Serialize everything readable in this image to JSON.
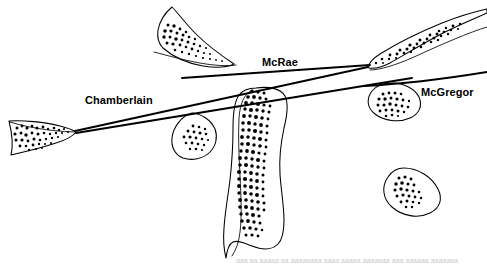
{
  "figure": {
    "type": "geological-sketch-map",
    "background_color": "#ffffff",
    "ink_color": "#000000",
    "width": 487,
    "height": 265,
    "labels": [
      {
        "id": "chamberlain",
        "text": "Chamberlain",
        "x": 85,
        "y": 95
      },
      {
        "id": "mcrae",
        "text": "McRae",
        "x": 262,
        "y": 57
      },
      {
        "id": "mcgregor",
        "text": "McGregor",
        "x": 421,
        "y": 87
      }
    ],
    "structural_lines": [
      {
        "name": "Chamberlain",
        "description": "long straight fault trace running from lower-left wedge tip up to the right convergence node",
        "path": "M 75 131 L 368 67"
      },
      {
        "name": "Chamberlain-splay",
        "description": "second near-parallel trace just below the Chamberlain line",
        "path": "M 76 133 L 410 78"
      },
      {
        "name": "McRae",
        "description": "straight trace beneath the McRae label, rising gently to the right node",
        "path": "M 182 77 L 369 65"
      },
      {
        "name": "McGregor",
        "description": "trace continuing to the right edge beneath the McGregor label",
        "path": "M 366 84 L 487 72"
      }
    ],
    "mineralized_bodies": [
      {
        "id": "west-wedge",
        "description": "triangular wedge at far left, apex east, stippled interior"
      },
      {
        "id": "north-flame",
        "description": "elongate flame-shaped body upper-left of centre, stippled"
      },
      {
        "id": "northeast-flame",
        "description": "elongate flame-shaped body at upper right, stippled"
      },
      {
        "id": "central-column",
        "description": "large elongate north-south column through the centre, densely stippled"
      },
      {
        "id": "small-triangle",
        "description": "small rounded-triangular body left of the central column"
      },
      {
        "id": "east-oval",
        "description": "oval body right of centre, crossed by the McGregor trace"
      },
      {
        "id": "southeast-oval",
        "description": "isolated oval body in the lower right, stippled"
      }
    ],
    "bottom_text_fragment": "aaa aa aaaaa aa aaaaaaaa aaaa aaaaa aaaaaaa aaa aaaaaa aaaaaaa"
  }
}
